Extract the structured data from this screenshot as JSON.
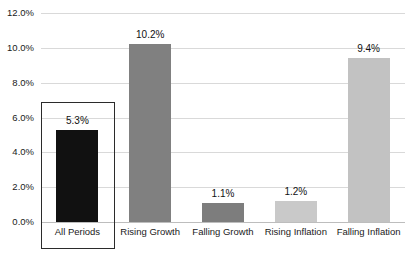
{
  "chart_data": {
    "type": "bar",
    "title": "",
    "subtitle": "",
    "xlabel": "",
    "ylabel": "",
    "categories": [
      "All Periods",
      "Rising Growth",
      "Falling Growth",
      "Rising Inflation",
      "Falling Inflation"
    ],
    "values": [
      5.3,
      10.2,
      1.1,
      1.2,
      9.4
    ],
    "value_labels": [
      "5.3%",
      "10.2%",
      "1.1%",
      "1.2%",
      "9.4%"
    ],
    "bar_colors": [
      "#111111",
      "#808080",
      "#7d7d7d",
      "#c9c9c9",
      "#c2c2c2"
    ],
    "ylim": [
      0,
      12
    ],
    "ytick_values": [
      0,
      2,
      4,
      6,
      8,
      10,
      12
    ],
    "ytick_labels": [
      "0.0%",
      "2.0%",
      "4.0%",
      "6.0%",
      "8.0%",
      "10.0%",
      "12.0%"
    ],
    "grid": true,
    "grid_color": "#d9d9d9",
    "legend": false,
    "legend_position": "none",
    "background_color": "#ffffff",
    "annotations": [
      {
        "type": "highlight-box",
        "target_category": "All Periods",
        "color": "#2b2b2b"
      }
    ]
  }
}
